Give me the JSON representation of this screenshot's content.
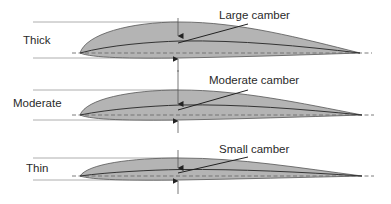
{
  "colors": {
    "fill": "#b4b4b4",
    "outline": "#555555",
    "mean_line": "#333333",
    "chord_line": "#6e6e6e",
    "guide": "#9a9a9a"
  },
  "airfoils": [
    {
      "thickness_label": "Thick",
      "camber_label": "Large camber"
    },
    {
      "thickness_label": "Moderate",
      "camber_label": "Moderate camber"
    },
    {
      "thickness_label": "Thin",
      "camber_label": "Small camber"
    }
  ]
}
